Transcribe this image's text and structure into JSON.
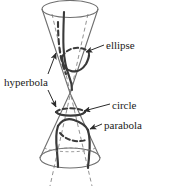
{
  "figure": {
    "background_color": "#ffffff",
    "outline_color": "#6b6b6b",
    "curve_color": "#3a3a3a",
    "text_color": "#1a1a1a",
    "width": 172,
    "height": 187
  },
  "labels": {
    "ellipse": "ellipse",
    "circle": "circle",
    "parabola": "parabola",
    "hyperbola": "hyperbola"
  },
  "geometry": {
    "upper_cone": {
      "description": "inverted cone, wide rim at top, apex at center",
      "rim_center_x": 70,
      "rim_center_y": 9,
      "rim_rx": 28,
      "rim_ry": 9,
      "apex_x": 70,
      "apex_y": 93
    },
    "lower_cone": {
      "description": "upright cone, apex at center, wide rim at bottom",
      "apex_x": 70,
      "apex_y": 93,
      "rim_center_x": 70,
      "rim_center_y": 158,
      "rim_rx": 30,
      "rim_ry": 10
    },
    "conics": [
      {
        "name": "ellipse",
        "cut": "oblique plane through one nappe",
        "on_cone": "upper"
      },
      {
        "name": "circle",
        "cut": "plane parallel to base",
        "on_cone": "lower"
      },
      {
        "name": "parabola",
        "cut": "plane parallel to a generating line",
        "on_cone": "lower"
      },
      {
        "name": "hyperbola",
        "cut": "plane cutting both nappes",
        "on_cone": "both"
      }
    ]
  }
}
